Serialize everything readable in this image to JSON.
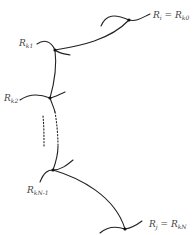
{
  "diagram": {
    "type": "region-chain",
    "nodes": [
      {
        "id": "n0",
        "label_main": "R",
        "label_sub": "i",
        "eq": " = ",
        "label2_main": "R",
        "label2_sub": "k0",
        "x": 129,
        "y": 20
      },
      {
        "id": "n1",
        "label_main": "R",
        "label_sub": "k1",
        "x": 55,
        "y": 50
      },
      {
        "id": "n2",
        "label_main": "R",
        "label_sub": "k2",
        "x": 50,
        "y": 98
      },
      {
        "id": "n3",
        "label_main": "R",
        "label_sub": "kN-1",
        "x": 53,
        "y": 170
      },
      {
        "id": "n4",
        "label_main": "R",
        "label_sub": "j",
        "eq": " = ",
        "label2_main": "R",
        "label2_sub": "kN",
        "x": 125,
        "y": 229
      }
    ],
    "edges": [
      {
        "from": "n0",
        "to": "n1",
        "style": "solid"
      },
      {
        "from": "n1",
        "to": "n2",
        "style": "solid"
      },
      {
        "from": "n2",
        "to": "n3",
        "style": "dotted-gap"
      },
      {
        "from": "n3",
        "to": "n4",
        "style": "solid"
      }
    ],
    "colors": {
      "stroke": "#222222",
      "label": "#444444",
      "background": "#ffffff"
    }
  }
}
